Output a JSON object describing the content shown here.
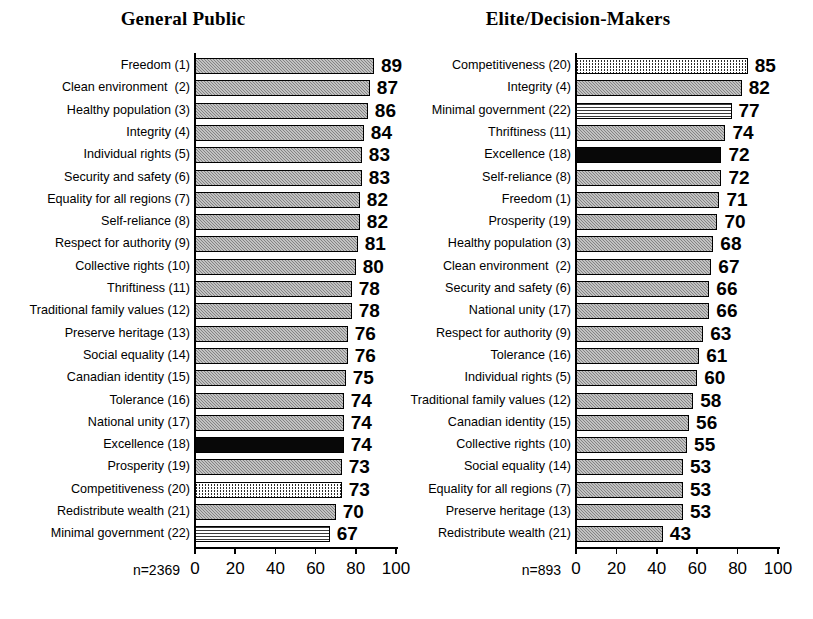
{
  "figure": {
    "background": "#ffffff",
    "bar_fill_gray": "#9a9a9a",
    "bar_fill_black": "#080808",
    "bar_outline": "#000000"
  },
  "chart_data": {
    "type": "bar",
    "title": "",
    "orientation": "horizontal",
    "grid": false,
    "legend": null,
    "xlabel": "",
    "ylabel": "",
    "xlim": [
      0,
      100
    ],
    "xticks": [
      0,
      20,
      40,
      60,
      80,
      100
    ],
    "panels": [
      {
        "title": "General Public",
        "sample_size_label": "n=2369",
        "xticks": [
          "0",
          "20",
          "40",
          "60",
          "80",
          "100"
        ],
        "categories": [
          "Freedom (1)",
          "Clean environment  (2)",
          "Healthy population (3)",
          "Integrity (4)",
          "Individual rights (5)",
          "Security and safety (6)",
          "Equality for all regions (7)",
          "Self-reliance (8)",
          "Respect for authority (9)",
          "Collective rights (10)",
          "Thriftiness (11)",
          "Traditional family values (12)",
          "Preserve heritage (13)",
          "Social equality (14)",
          "Canadian identity (15)",
          "Tolerance (16)",
          "National unity (17)",
          "Excellence (18)",
          "Prosperity (19)",
          "Competitiveness (20)",
          "Redistribute wealth (21)",
          "Minimal government (22)"
        ],
        "values": [
          89,
          87,
          86,
          84,
          83,
          83,
          82,
          82,
          81,
          80,
          78,
          78,
          76,
          76,
          75,
          74,
          74,
          74,
          73,
          73,
          70,
          67
        ],
        "fills": [
          "stipple-gray",
          "stipple-gray",
          "stipple-gray",
          "stipple-gray",
          "stipple-gray",
          "stipple-gray",
          "stipple-gray",
          "stipple-gray",
          "stipple-gray",
          "stipple-gray",
          "stipple-gray",
          "stipple-gray",
          "stipple-gray",
          "stipple-gray",
          "stipple-gray",
          "stipple-gray",
          "stipple-gray",
          "solid-black",
          "stipple-gray",
          "diagonal-hatch",
          "stipple-gray",
          "horizontal-lines"
        ]
      },
      {
        "title": "Elite/Decision-Makers",
        "sample_size_label": "n=893",
        "xticks": [
          "0",
          "20",
          "40",
          "60",
          "80",
          "100"
        ],
        "categories": [
          "Competitiveness (20)",
          "Integrity (4)",
          "Minimal government (22)",
          "Thriftiness (11)",
          "Excellence (18)",
          "Self-reliance (8)",
          "Freedom (1)",
          "Prosperity (19)",
          "Healthy population (3)",
          "Clean environment  (2)",
          "Security and safety (6)",
          "National unity (17)",
          "Respect for authority (9)",
          "Tolerance (16)",
          "Individual rights (5)",
          "Traditional family values (12)",
          "Canadian identity (15)",
          "Collective rights (10)",
          "Social equality (14)",
          "Equality for all regions (7)",
          "Preserve heritage (13)",
          "Redistribute wealth (21)"
        ],
        "values": [
          85,
          82,
          77,
          74,
          72,
          72,
          71,
          70,
          68,
          67,
          66,
          66,
          63,
          61,
          60,
          58,
          56,
          55,
          53,
          53,
          53,
          43
        ],
        "fills": [
          "diagonal-hatch",
          "stipple-gray",
          "horizontal-lines",
          "stipple-gray",
          "solid-black",
          "stipple-gray",
          "stipple-gray",
          "stipple-gray",
          "stipple-gray",
          "stipple-gray",
          "stipple-gray",
          "stipple-gray",
          "stipple-gray",
          "stipple-gray",
          "stipple-gray",
          "stipple-gray",
          "stipple-gray",
          "stipple-gray",
          "stipple-gray",
          "stipple-gray",
          "stipple-gray",
          "stipple-gray"
        ]
      }
    ]
  }
}
